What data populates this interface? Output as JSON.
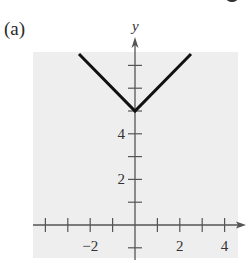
{
  "panel_label": "(a)",
  "chart_data": {
    "type": "line",
    "title": "",
    "xlabel": "",
    "ylabel": "y",
    "function": "y = |x| + 5",
    "series": [
      {
        "name": "y=|x|+5",
        "x": [
          -2.5,
          0,
          2.5
        ],
        "y": [
          7.5,
          5,
          7.5
        ]
      }
    ],
    "xlim": [
      -4.5,
      4.5
    ],
    "ylim": [
      -1.5,
      7.5
    ],
    "x_ticks": [
      -4,
      -3,
      -2,
      -1,
      1,
      2,
      3,
      4
    ],
    "x_tick_labels": [
      "-2",
      "2",
      "4"
    ],
    "x_tick_label_values": [
      -2,
      2,
      4
    ],
    "y_ticks": [
      -1,
      1,
      2,
      3,
      4,
      5,
      6,
      7
    ],
    "y_tick_labels": [
      "2",
      "4"
    ],
    "y_tick_label_values": [
      2,
      4
    ],
    "grid": true,
    "background": "#eeeeee",
    "line_color": "#111111",
    "axis_color": "#555555"
  }
}
